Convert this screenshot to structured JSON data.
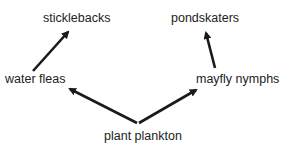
{
  "diagram": {
    "type": "food-web",
    "nodes": [
      {
        "id": "sticklebacks",
        "label": "sticklebacks"
      },
      {
        "id": "pondskaters",
        "label": "pondskaters"
      },
      {
        "id": "water_fleas",
        "label": "water fleas"
      },
      {
        "id": "mayfly_nymphs",
        "label": "mayfly nymphs"
      },
      {
        "id": "plant_plankton",
        "label": "plant plankton"
      }
    ],
    "edges": [
      {
        "from": "plant_plankton",
        "to": "water_fleas"
      },
      {
        "from": "plant_plankton",
        "to": "mayfly_nymphs"
      },
      {
        "from": "water_fleas",
        "to": "sticklebacks"
      },
      {
        "from": "mayfly_nymphs",
        "to": "pondskaters"
      }
    ],
    "colors": {
      "arrow": "#1a1a1a",
      "text": "#222222",
      "background": "#ffffff"
    }
  }
}
